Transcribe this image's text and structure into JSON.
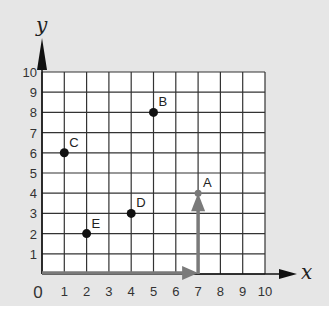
{
  "diagram": {
    "type": "coordinate-grid",
    "axes": {
      "x": {
        "label": "x",
        "min": 0,
        "max": 10,
        "ticks": [
          "1",
          "2",
          "3",
          "4",
          "5",
          "6",
          "7",
          "8",
          "9",
          "10"
        ]
      },
      "y": {
        "label": "y",
        "min": 0,
        "max": 10,
        "ticks": [
          "1",
          "2",
          "3",
          "4",
          "5",
          "6",
          "7",
          "8",
          "9",
          "10"
        ]
      },
      "origin_label": "0"
    },
    "points": [
      {
        "label": "A",
        "x": 7,
        "y": 4
      },
      {
        "label": "B",
        "x": 5,
        "y": 8
      },
      {
        "label": "C",
        "x": 1,
        "y": 6
      },
      {
        "label": "D",
        "x": 4,
        "y": 3
      },
      {
        "label": "E",
        "x": 2,
        "y": 2
      }
    ],
    "path_arrows": [
      {
        "from": [
          0,
          0
        ],
        "to": [
          7,
          0
        ],
        "color": "#7a7a7a"
      },
      {
        "from": [
          7,
          0
        ],
        "to": [
          7,
          4
        ],
        "color": "#7a7a7a"
      }
    ],
    "colors": {
      "background": "#e6e6e6",
      "grid_fill": "#ffffff",
      "grid_line": "#333333",
      "point": "#111111",
      "path_arrow": "#7a7a7a",
      "axis_arrow": "#111111"
    }
  }
}
